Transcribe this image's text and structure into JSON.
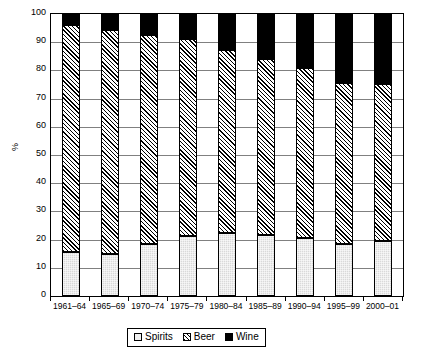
{
  "chart_data": {
    "type": "bar",
    "subtype": "stacked-100-percent-column",
    "title": "",
    "xlabel": "",
    "ylabel": "%",
    "ylim": [
      0,
      100
    ],
    "ytick_step": 10,
    "yticks": [
      100,
      90,
      80,
      70,
      60,
      50,
      40,
      30,
      20,
      10,
      0
    ],
    "grid": true,
    "grid_axis": "y",
    "legend_position": "bottom-center",
    "categories": [
      "1961–64",
      "1965–69",
      "1970–74",
      "1975–79",
      "1980–84",
      "1985–89",
      "1990–94",
      "1995–99",
      "2000–01"
    ],
    "series": [
      {
        "name": "Spirits",
        "fill": "light-grey-solid",
        "color": "#d9d9d9",
        "values": [
          15.7,
          15.0,
          18.6,
          21.1,
          22.2,
          21.5,
          20.6,
          18.3,
          19.6
        ]
      },
      {
        "name": "Beer",
        "fill": "diagonal-hatch",
        "color": "#ffffff",
        "values": [
          80.4,
          79.4,
          73.9,
          69.9,
          65.1,
          62.4,
          60.1,
          57.2,
          55.6
        ]
      },
      {
        "name": "Wine",
        "fill": "solid-black",
        "color": "#000000",
        "values": [
          3.9,
          5.6,
          7.5,
          9.0,
          12.7,
          16.1,
          19.3,
          24.5,
          24.8
        ]
      }
    ],
    "cumulative_tops": {
      "spirits_top": [
        15.7,
        15.0,
        18.6,
        21.1,
        22.2,
        21.5,
        20.6,
        18.3,
        19.6
      ],
      "beer_top": [
        96.1,
        94.4,
        92.5,
        91.0,
        87.3,
        83.9,
        80.7,
        75.5,
        75.2
      ]
    }
  },
  "legend": {
    "items": [
      {
        "label": "Spirits",
        "swatch": "spirits-swatch"
      },
      {
        "label": "Beer",
        "swatch": "beer-swatch"
      },
      {
        "label": "Wine",
        "swatch": "wine-swatch"
      }
    ]
  },
  "colors": {
    "axis": "#000000",
    "gridline": "#808080",
    "plot_background": "#ffffff",
    "spirits": "#d9d9d9",
    "beer_hatch": "#000000",
    "wine": "#000000"
  }
}
